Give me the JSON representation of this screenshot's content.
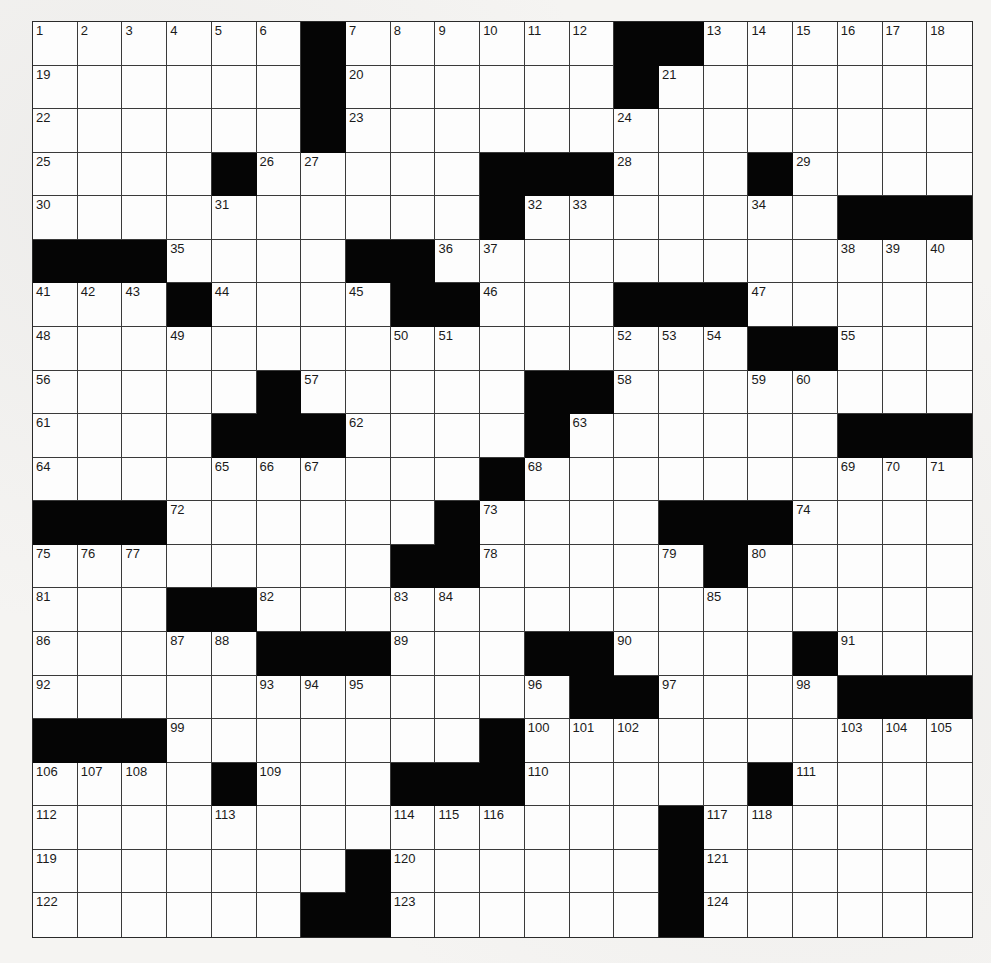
{
  "puzzle": {
    "rows": 21,
    "cols": 21,
    "colors": {
      "black_square": "#050505",
      "white_square": "#fbfbfa",
      "grid_line": "#3a3a3a",
      "background": "#f5f4f2"
    },
    "legend": "Each row lists 21 cells: '#' = black square, number = clue number, '' = empty white square",
    "grid": [
      [
        "1",
        "2",
        "3",
        "4",
        "5",
        "6",
        "#",
        "7",
        "8",
        "9",
        "10",
        "11",
        "12",
        "#",
        "#",
        "13",
        "14",
        "15",
        "16",
        "17",
        "18"
      ],
      [
        "19",
        "",
        "",
        "",
        "",
        "",
        "#",
        "20",
        "",
        "",
        "",
        "",
        "",
        "#",
        "21",
        "",
        "",
        "",
        "",
        "",
        ""
      ],
      [
        "22",
        "",
        "",
        "",
        "",
        "",
        "#",
        "23",
        "",
        "",
        "",
        "",
        "",
        "24",
        "",
        "",
        "",
        "",
        "",
        "",
        ""
      ],
      [
        "25",
        "",
        "",
        "",
        "#",
        "26",
        "27",
        "",
        "",
        "",
        "#",
        "#",
        "#",
        "28",
        "",
        "",
        "#",
        "29",
        "",
        "",
        ""
      ],
      [
        "30",
        "",
        "",
        "",
        "31",
        "",
        "",
        "",
        "",
        "",
        "#",
        "32",
        "33",
        "",
        "",
        "",
        "34",
        "",
        "#",
        "#",
        "#"
      ],
      [
        "#",
        "#",
        "#",
        "35",
        "",
        "",
        "",
        "#",
        "#",
        "36",
        "37",
        "",
        "",
        "",
        "",
        "",
        "",
        "",
        "38",
        "39",
        "40"
      ],
      [
        "41",
        "42",
        "43",
        "#",
        "44",
        "",
        "",
        "45",
        "#",
        "#",
        "46",
        "",
        "",
        "#",
        "#",
        "#",
        "47",
        "",
        "",
        "",
        ""
      ],
      [
        "48",
        "",
        "",
        "49",
        "",
        "",
        "",
        "",
        "50",
        "51",
        "",
        "",
        "",
        "52",
        "53",
        "54",
        "#",
        "#",
        "55",
        "",
        ""
      ],
      [
        "56",
        "",
        "",
        "",
        "",
        "#",
        "57",
        "",
        "",
        "",
        "",
        "#",
        "#",
        "58",
        "",
        "",
        "59",
        "60",
        "",
        "",
        ""
      ],
      [
        "61",
        "",
        "",
        "",
        "#",
        "#",
        "#",
        "62",
        "",
        "",
        "",
        "#",
        "63",
        "",
        "",
        "",
        "",
        "",
        "#",
        "#",
        "#"
      ],
      [
        "64",
        "",
        "",
        "",
        "65",
        "66",
        "67",
        "",
        "",
        "",
        "#",
        "68",
        "",
        "",
        "",
        "",
        "",
        "",
        "69",
        "70",
        "71"
      ],
      [
        "#",
        "#",
        "#",
        "72",
        "",
        "",
        "",
        "",
        "",
        "#",
        "73",
        "",
        "",
        "",
        "#",
        "#",
        "#",
        "74",
        "",
        "",
        ""
      ],
      [
        "75",
        "76",
        "77",
        "",
        "",
        "",
        "",
        "",
        "#",
        "#",
        "78",
        "",
        "",
        "",
        "79",
        "#",
        "80",
        "",
        "",
        "",
        ""
      ],
      [
        "81",
        "",
        "",
        "#",
        "#",
        "82",
        "",
        "",
        "83",
        "84",
        "",
        "",
        "",
        "",
        "",
        "85",
        "",
        "",
        "",
        "",
        ""
      ],
      [
        "86",
        "",
        "",
        "87",
        "88",
        "#",
        "#",
        "#",
        "89",
        "",
        "",
        "#",
        "#",
        "90",
        "",
        "",
        "",
        "#",
        "91",
        "",
        ""
      ],
      [
        "92",
        "",
        "",
        "",
        "",
        "93",
        "94",
        "95",
        "",
        "",
        "",
        "96",
        "#",
        "#",
        "97",
        "",
        "",
        "98",
        "#",
        "#",
        "#"
      ],
      [
        "#",
        "#",
        "#",
        "99",
        "",
        "",
        "",
        "",
        "",
        "",
        "#",
        "100",
        "101",
        "102",
        "",
        "",
        "",
        "",
        "103",
        "104",
        "105"
      ],
      [
        "106",
        "107",
        "108",
        "",
        "#",
        "109",
        "",
        "",
        "#",
        "#",
        "#",
        "110",
        "",
        "",
        "",
        "",
        "#",
        "111",
        "",
        "",
        ""
      ],
      [
        "112",
        "",
        "",
        "",
        "113",
        "",
        "",
        "",
        "114",
        "115",
        "116",
        "",
        "",
        "",
        "#",
        "117",
        "118",
        "",
        "",
        "",
        ""
      ],
      [
        "119",
        "",
        "",
        "",
        "",
        "",
        "",
        "#",
        "120",
        "",
        "",
        "",
        "",
        "",
        "#",
        "121",
        "",
        "",
        "",
        "",
        ""
      ],
      [
        "122",
        "",
        "",
        "",
        "",
        "",
        "#",
        "#",
        "123",
        "",
        "",
        "",
        "",
        "",
        "#",
        "124",
        "",
        "",
        "",
        "",
        ""
      ]
    ]
  }
}
